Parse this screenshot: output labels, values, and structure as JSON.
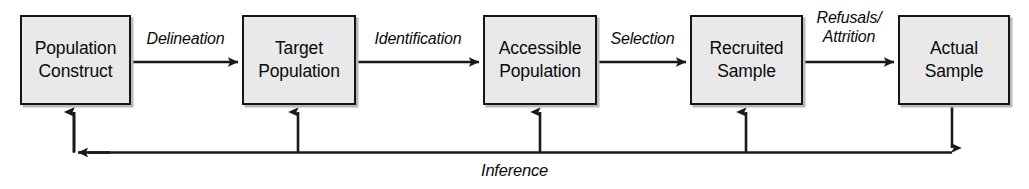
{
  "diagram": {
    "colors": {
      "box_fill": "#e9e9e9",
      "box_border": "#151515",
      "box_shadow": "#b9b9b9",
      "line": "#1a1a1a",
      "background": "#ffffff",
      "text": "#0a0a0a"
    },
    "nodes": [
      {
        "id": "population-construct",
        "line1": "Population",
        "line2": "Construct"
      },
      {
        "id": "target-population",
        "line1": "Target",
        "line2": "Population"
      },
      {
        "id": "accessible-population",
        "line1": "Accessible",
        "line2": "Population"
      },
      {
        "id": "recruited-sample",
        "line1": "Recruited",
        "line2": "Sample"
      },
      {
        "id": "actual-sample",
        "line1": "Actual",
        "line2": "Sample"
      }
    ],
    "edges": [
      {
        "id": "delineation",
        "line1": "Delineation",
        "line2": ""
      },
      {
        "id": "identification",
        "line1": "Identification",
        "line2": ""
      },
      {
        "id": "selection",
        "line1": "Selection",
        "line2": ""
      },
      {
        "id": "refusals-attrition",
        "line1": "Refusals/",
        "line2": "Attrition"
      }
    ],
    "feedback": {
      "id": "inference",
      "label": "Inference"
    }
  }
}
